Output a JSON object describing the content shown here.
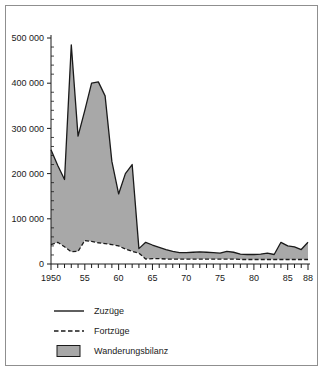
{
  "figure": {
    "background_color": "#ffffff",
    "frame_color": "#8f8f8f",
    "axis_color": "#1a1a1a",
    "fill_color": "#a8a8a8"
  },
  "legend": {
    "position": "bottom-left",
    "entries": [
      {
        "label": "Zuzüge",
        "marker": "solid-line",
        "color": "#1a1a1a"
      },
      {
        "label": "Fortzüge",
        "marker": "dashed-line",
        "color": "#1a1a1a"
      },
      {
        "label": "Wanderungsbilanz",
        "marker": "filled-swatch",
        "color": "#a8a8a8"
      }
    ]
  },
  "axes": {
    "y_ticks": [
      "0",
      "100 000",
      "200 000",
      "300 000",
      "400 000",
      "500 000"
    ],
    "x_ticks": [
      "1950",
      "55",
      "60",
      "65",
      "70",
      "75",
      "80",
      "85",
      "88"
    ]
  },
  "chart_data": {
    "type": "area",
    "title": "",
    "subtitle": "",
    "xlabel": "",
    "ylabel": "",
    "xlim": [
      1950,
      1988
    ],
    "ylim": [
      0,
      500000
    ],
    "grid": false,
    "legend_position": "bottom-left",
    "x": [
      1950,
      1951,
      1952,
      1953,
      1954,
      1955,
      1956,
      1957,
      1958,
      1959,
      1960,
      1961,
      1962,
      1963,
      1964,
      1965,
      1966,
      1967,
      1968,
      1969,
      1970,
      1971,
      1972,
      1973,
      1974,
      1975,
      1976,
      1977,
      1978,
      1979,
      1980,
      1981,
      1982,
      1983,
      1984,
      1985,
      1986,
      1987,
      1988
    ],
    "x_tick_labels": [
      "1950",
      "55",
      "60",
      "65",
      "70",
      "75",
      "80",
      "85",
      "88"
    ],
    "x_tick_values": [
      1950,
      1955,
      1960,
      1965,
      1970,
      1975,
      1980,
      1985,
      1988
    ],
    "y_tick_labels": [
      "0",
      "100 000",
      "200 000",
      "300 000",
      "400 000",
      "500 000"
    ],
    "y_tick_values": [
      0,
      100000,
      200000,
      300000,
      400000,
      500000
    ],
    "series": [
      {
        "name": "Zuzüge",
        "style": "solid",
        "color": "#1a1a1a",
        "values": [
          253000,
          218000,
          187000,
          485000,
          283000,
          340000,
          400000,
          403000,
          372000,
          227000,
          155000,
          200000,
          220000,
          34000,
          48000,
          42000,
          37000,
          32000,
          28000,
          25000,
          25000,
          26000,
          27000,
          26000,
          25000,
          24000,
          28000,
          26000,
          22000,
          21000,
          21000,
          22000,
          24000,
          21000,
          48000,
          40000,
          38000,
          32000,
          48000
        ]
      },
      {
        "name": "Fortzüge",
        "style": "dashed",
        "color": "#1a1a1a",
        "values": [
          43000,
          48000,
          38000,
          27000,
          28000,
          52000,
          50000,
          47000,
          45000,
          43000,
          40000,
          33000,
          28000,
          24000,
          11000,
          12000,
          12000,
          11000,
          11000,
          11000,
          11000,
          11000,
          11000,
          11000,
          11000,
          11000,
          11000,
          11000,
          10000,
          10000,
          10000,
          10000,
          10000,
          10000,
          10000,
          10000,
          10000,
          10000,
          10000
        ]
      }
    ],
    "band": {
      "name": "Wanderungsbilanz",
      "description": "Shaded area between Zuzüge and Fortzüge",
      "fill_color": "#a8a8a8"
    }
  }
}
